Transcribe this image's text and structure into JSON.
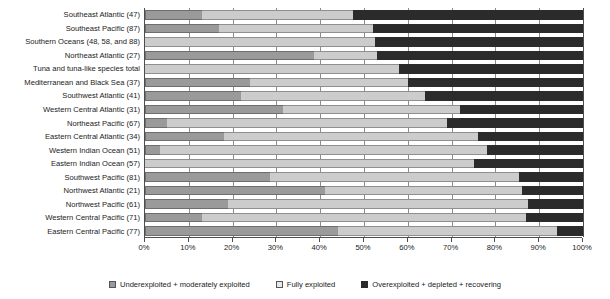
{
  "chart_data": {
    "type": "bar",
    "orientation": "horizontal",
    "stacked": true,
    "stack_mode": "percent",
    "title": "",
    "subtitle": "",
    "xlabel": "",
    "ylabel": "",
    "xlim": [
      0,
      100
    ],
    "grid": true,
    "legend_position": "bottom",
    "xticklabels": [
      "0%",
      "10%",
      "20%",
      "30%",
      "40%",
      "50%",
      "60%",
      "70%",
      "80%",
      "90%",
      "100%"
    ],
    "xticks": [
      0,
      10,
      20,
      30,
      40,
      50,
      60,
      70,
      80,
      90,
      100
    ],
    "categories": [
      "Southeast Atlantic (47)",
      "Southeast  Pacific (87)",
      "Southern Oceans (48, 58, and 88)",
      "Northeast Atlantic (27)",
      "Tuna and tuna-like species total",
      "Mediterranean and Black Sea (37)",
      "Southwest Atlantic (41)",
      "Western Central Atlantic (31)",
      "Northeast Pacific (67)",
      "Eastern Central Atlantic (34)",
      "Western Indian Ocean (51)",
      "Eastern Indian Ocean (57)",
      "Southwest Pacific (81)",
      "Northwest Atlantic (21)",
      "Northwest Pacific (61)",
      "Western Central Pacific (71)",
      "Eastern Central Pacific (77)"
    ],
    "series": [
      {
        "name": "Underexploited + moderately exploited",
        "color": "#9a9a9a",
        "values": [
          13,
          17,
          0,
          38.5,
          0,
          24,
          22,
          31.5,
          5,
          18,
          3.5,
          0,
          28.5,
          41,
          19,
          13,
          44
        ]
      },
      {
        "name": "Fully exploited",
        "color": "#cccccc",
        "values": [
          34.5,
          35,
          52.5,
          14.5,
          58,
          36,
          42,
          40.5,
          64,
          58,
          74.5,
          75,
          57,
          45,
          68.5,
          74,
          50
        ]
      },
      {
        "name": "Overexploited + depleted + recovering",
        "color": "#2b2b2b",
        "values": [
          52.5,
          48,
          47.5,
          47,
          42,
          40,
          36,
          28,
          31,
          24,
          22,
          25,
          14.5,
          14,
          12.5,
          13,
          6
        ]
      }
    ]
  },
  "legend": {
    "items": [
      {
        "label": "Underexploited + moderately exploited"
      },
      {
        "label": "Fully exploited"
      },
      {
        "label": "Overexploited + depleted + recovering"
      }
    ]
  },
  "colors": {
    "underexploited": "#9a9a9a",
    "fully_exploited": "#cccccc",
    "overexploited": "#2b2b2b",
    "axis": "#4d4d4d",
    "grid": "#8c8c8c",
    "background": "#ffffff"
  }
}
